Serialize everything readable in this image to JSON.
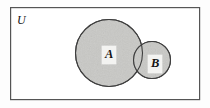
{
  "figure": {
    "type": "venn-diagram",
    "background_color": "#fdfdfd"
  },
  "universe": {
    "label": "U",
    "rect": {
      "x": 10,
      "y": 7,
      "width": 190,
      "height": 93
    },
    "border_color": "#555555",
    "border_width": 1.2,
    "fill_color": "#ffffff"
  },
  "sets": [
    {
      "name": "set-a",
      "label": "A",
      "cx": 109,
      "cy": 53,
      "r": 34,
      "fill_color": "#c9c9c6",
      "stroke_color": "#3f3f3f"
    },
    {
      "name": "set-b",
      "label": "B",
      "cx": 152,
      "cy": 60,
      "r": 19,
      "fill_color": "#c9c9c6",
      "stroke_color": "#3f3f3f"
    }
  ],
  "colors": {
    "shade": "#c9c9c6",
    "stroke": "#3f3f3f",
    "frame": "#555555",
    "text": "#141414",
    "label_box": "#f3f3f1"
  }
}
